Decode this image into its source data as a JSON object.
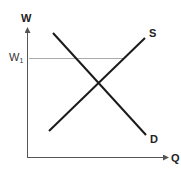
{
  "diagram": {
    "type": "supply-demand",
    "y_axis_label": "W",
    "x_axis_label": "Q",
    "reference_level": {
      "label_main": "W",
      "label_sub": "1"
    },
    "curves": [
      {
        "name": "S",
        "label": "S",
        "slope": "upward"
      },
      {
        "name": "D",
        "label": "D",
        "slope": "downward"
      }
    ],
    "colors": {
      "curve": "#1a1a1a",
      "axis": "#555555",
      "reference_line": "#aaaaaa"
    }
  }
}
